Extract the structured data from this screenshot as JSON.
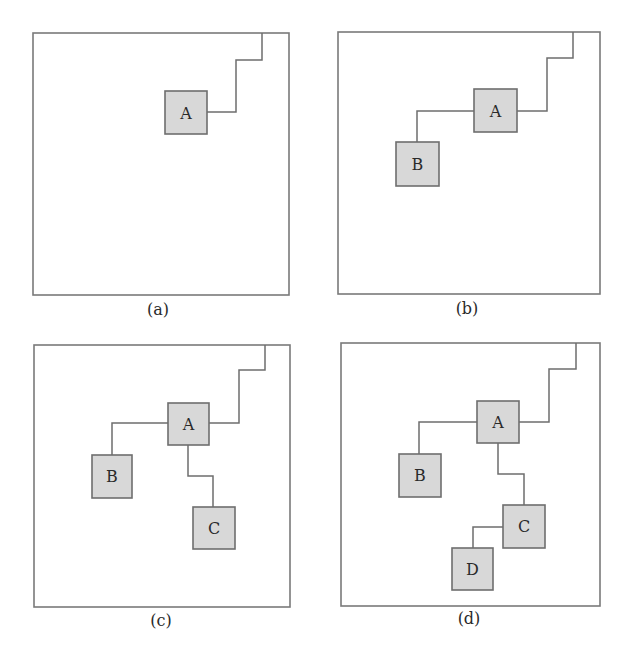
{
  "figure": {
    "panels": [
      {
        "id": "a",
        "caption": "(a)",
        "nodes": [
          {
            "label": "A"
          }
        ]
      },
      {
        "id": "b",
        "caption": "(b)",
        "nodes": [
          {
            "label": "A"
          },
          {
            "label": "B"
          }
        ]
      },
      {
        "id": "c",
        "caption": "(c)",
        "nodes": [
          {
            "label": "A"
          },
          {
            "label": "B"
          },
          {
            "label": "C"
          }
        ]
      },
      {
        "id": "d",
        "caption": "(d)",
        "nodes": [
          {
            "label": "A"
          },
          {
            "label": "B"
          },
          {
            "label": "C"
          },
          {
            "label": "D"
          }
        ]
      }
    ],
    "colors": {
      "node_fill": "#d8d8d8",
      "stroke": "#6e6e6e",
      "background": "#ffffff"
    }
  }
}
